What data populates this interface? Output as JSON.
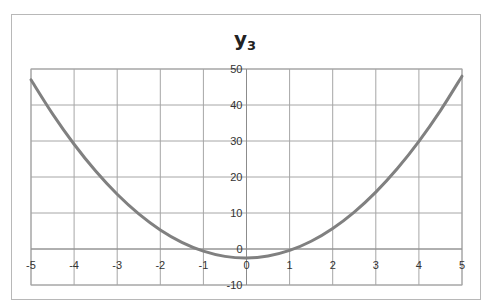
{
  "chart_data": {
    "type": "line",
    "title": "y",
    "title_subscript": "3",
    "xlabel": "",
    "ylabel": "",
    "xlim": [
      -5,
      5
    ],
    "ylim": [
      -10,
      50
    ],
    "x_ticks": [
      -5,
      -4,
      -3,
      -2,
      -1,
      0,
      1,
      2,
      3,
      4,
      5
    ],
    "y_ticks": [
      -10,
      0,
      10,
      20,
      30,
      40,
      50
    ],
    "grid": true,
    "legend": "none",
    "series": [
      {
        "name": "y3",
        "color": "#808080",
        "x": [
          -5,
          -4.5,
          -4,
          -3.5,
          -3,
          -2.5,
          -2,
          -1.5,
          -1,
          -0.5,
          0,
          0.5,
          1,
          1.5,
          2,
          2.5,
          3,
          3.5,
          4,
          4.5,
          5
        ],
        "values": [
          47,
          37.55,
          29.1,
          21.65,
          15.2,
          9.75,
          5.3,
          1.85,
          -0.6,
          -2.05,
          -2.5,
          -1.95,
          -0.4,
          2.15,
          5.7,
          10.25,
          15.8,
          22.35,
          29.9,
          38.45,
          48
        ]
      }
    ]
  },
  "plot_area": {
    "left": 31,
    "right": 462,
    "top": 69,
    "bottom": 285
  }
}
